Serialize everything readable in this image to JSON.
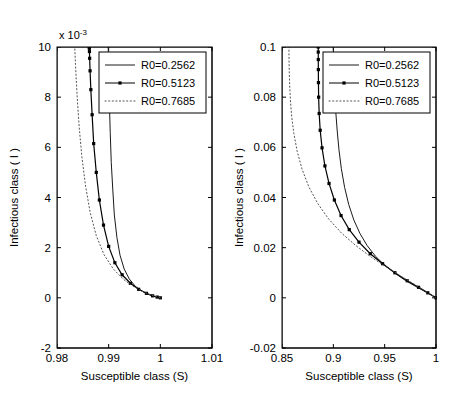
{
  "figure": {
    "panels": [
      {
        "tag": "(a)",
        "name": "panel-a",
        "xlabel": "Susceptible class (S)",
        "ylabel": "Infectious class ( I )",
        "y_multiplier": "x 10",
        "y_multiplier_exp": "-3",
        "xticks": [
          "0.98",
          "0.99",
          "1",
          "1.01"
        ],
        "xtick_values": [
          0.98,
          0.99,
          1.0,
          1.01
        ],
        "yticks": [
          "-2",
          "0",
          "2",
          "4",
          "6",
          "8",
          "10"
        ],
        "ytick_values": [
          -2,
          0,
          2,
          4,
          6,
          8,
          10
        ],
        "xlim": [
          0.98,
          1.01
        ],
        "ylim": [
          -2,
          10
        ]
      },
      {
        "tag": "(b)",
        "name": "panel-b",
        "xlabel": "Susceptible class (S)",
        "ylabel": "Infectious class ( I )",
        "y_multiplier": "",
        "y_multiplier_exp": "",
        "xticks": [
          "0.85",
          "0.9",
          "0.95",
          "1"
        ],
        "xtick_values": [
          0.85,
          0.9,
          0.95,
          1.0
        ],
        "yticks": [
          "-0.02",
          "0",
          "0.02",
          "0.04",
          "0.06",
          "0.08",
          "0.1"
        ],
        "ytick_values": [
          -0.02,
          0,
          0.02,
          0.04,
          0.06,
          0.08,
          0.1
        ],
        "xlim": [
          0.85,
          1.0
        ],
        "ylim": [
          -0.02,
          0.1
        ]
      }
    ],
    "legend": {
      "entries": [
        {
          "label": "R0=0.2562",
          "style": "solid",
          "color": "#1a1a1a"
        },
        {
          "label": "R0=0.5123",
          "style": "marked",
          "color": "#000000"
        },
        {
          "label": "R0=0.7685",
          "style": "dotted",
          "color": "#555555"
        }
      ]
    }
  },
  "chart_data": {
    "type": "line",
    "title": "",
    "subtitle": "",
    "n_panels": 2,
    "legend_position": "top-right inside axes",
    "grid": false,
    "panels": [
      {
        "tag": "(a)",
        "xlabel": "Susceptible class (S)",
        "ylabel": "Infectious class ( I )",
        "xlim": [
          0.98,
          1.01
        ],
        "ylim": [
          -0.002,
          0.01
        ],
        "y_tick_multiplier": 0.001,
        "xticks": [
          0.98,
          0.99,
          1.0,
          1.01
        ],
        "yticks": [
          -0.002,
          0.0,
          0.002,
          0.004,
          0.006,
          0.008,
          0.01
        ],
        "series": [
          {
            "name": "R0=0.2562",
            "style": "solid",
            "color": "#1a1a1a",
            "x": [
              1.0,
              0.9995,
              0.9988,
              0.9978,
              0.9966,
              0.9952,
              0.994,
              0.993,
              0.9922,
              0.9916,
              0.9911,
              0.9908,
              0.9905,
              0.9903,
              0.99015,
              0.99005,
              0.98998,
              0.98994,
              0.98992,
              0.98991
            ],
            "y": [
              0.0,
              2e-05,
              6e-05,
              0.00013,
              0.00025,
              0.00045,
              0.00075,
              0.00115,
              0.0017,
              0.0024,
              0.0033,
              0.0043,
              0.0054,
              0.0066,
              0.0077,
              0.0086,
              0.00925,
              0.00965,
              0.0099,
              0.01
            ]
          },
          {
            "name": "R0=0.5123",
            "style": "marked",
            "color": "#000000",
            "x": [
              1.0,
              0.9994,
              0.9985,
              0.9973,
              0.9958,
              0.9942,
              0.9926,
              0.9912,
              0.99,
              0.989,
              0.9882,
              0.9876,
              0.9871,
              0.9868,
              0.98655,
              0.9864,
              0.98632,
              0.98628,
              0.98626,
              0.98625
            ],
            "y": [
              0.0,
              3e-05,
              8e-05,
              0.00018,
              0.00034,
              0.00058,
              0.00092,
              0.0014,
              0.00205,
              0.0029,
              0.0039,
              0.005,
              0.00615,
              0.0073,
              0.0083,
              0.00905,
              0.00955,
              0.00982,
              0.00995,
              0.01
            ]
          },
          {
            "name": "R0=0.7685",
            "style": "dotted",
            "color": "#555555",
            "x": [
              1.0,
              0.9993,
              0.9982,
              0.9967,
              0.9949,
              0.9929,
              0.9909,
              0.9891,
              0.9876,
              0.9864,
              0.9855,
              0.9848,
              0.9843,
              0.98395,
              0.98372,
              0.98358,
              0.9835,
              0.98346,
              0.98344,
              0.98343
            ],
            "y": [
              0.0,
              4e-05,
              0.00011,
              0.00024,
              0.00044,
              0.00073,
              0.00115,
              0.00172,
              0.00248,
              0.00342,
              0.0045,
              0.00565,
              0.0068,
              0.00785,
              0.00872,
              0.0093,
              0.00968,
              0.00988,
              0.00997,
              0.01
            ]
          }
        ]
      },
      {
        "tag": "(b)",
        "xlabel": "Susceptible class (S)",
        "ylabel": "Infectious class ( I )",
        "xlim": [
          0.85,
          1.0
        ],
        "ylim": [
          -0.02,
          0.1
        ],
        "y_tick_multiplier": 1,
        "xticks": [
          0.85,
          0.9,
          0.95,
          1.0
        ],
        "yticks": [
          -0.02,
          0.0,
          0.02,
          0.04,
          0.06,
          0.08,
          0.1
        ],
        "series": [
          {
            "name": "R0=0.2562",
            "style": "solid",
            "color": "#1a1a1a",
            "x": [
              1.0,
              0.995,
              0.988,
              0.98,
              0.97,
              0.96,
              0.95,
              0.941,
              0.933,
              0.926,
              0.92,
              0.915,
              0.911,
              0.9078,
              0.9055,
              0.9038,
              0.9025,
              0.9016,
              0.901,
              0.9006,
              0.9003,
              0.9001,
              0.9
            ],
            "y": [
              0.0,
              0.0012,
              0.0028,
              0.0046,
              0.007,
              0.0098,
              0.013,
              0.0166,
              0.0208,
              0.0256,
              0.031,
              0.0372,
              0.044,
              0.0515,
              0.059,
              0.0665,
              0.0735,
              0.08,
              0.0858,
              0.0905,
              0.0945,
              0.0978,
              0.1
            ]
          },
          {
            "name": "R0=0.5123",
            "style": "marked",
            "color": "#000000",
            "x": [
              1.0,
              0.992,
              0.983,
              0.972,
              0.96,
              0.948,
              0.936,
              0.925,
              0.9155,
              0.9075,
              0.901,
              0.8958,
              0.8918,
              0.889,
              0.8872,
              0.8862,
              0.8857,
              0.8855,
              0.8854,
              0.88535,
              0.88532,
              0.8853
            ],
            "y": [
              0.0,
              0.002,
              0.0042,
              0.0068,
              0.01,
              0.0136,
              0.0176,
              0.0222,
              0.0272,
              0.0328,
              0.039,
              0.0456,
              0.0526,
              0.0598,
              0.0668,
              0.0735,
              0.08,
              0.0858,
              0.091,
              0.095,
              0.098,
              0.1
            ]
          },
          {
            "name": "R0=0.7685",
            "style": "dotted",
            "color": "#555555",
            "x": [
              1.0,
              0.99,
              0.979,
              0.966,
              0.952,
              0.937,
              0.922,
              0.908,
              0.8955,
              0.8848,
              0.8762,
              0.8696,
              0.8648,
              0.8615,
              0.8594,
              0.8582,
              0.8575,
              0.8571,
              0.8569,
              0.85682,
              0.85678,
              0.85675
            ],
            "y": [
              0.0,
              0.0026,
              0.0054,
              0.0086,
              0.0122,
              0.0162,
              0.0208,
              0.0258,
              0.0314,
              0.0376,
              0.0442,
              0.0512,
              0.0584,
              0.0656,
              0.0724,
              0.0788,
              0.0846,
              0.0896,
              0.0936,
              0.0966,
              0.0988,
              0.1
            ]
          }
        ]
      }
    ]
  }
}
